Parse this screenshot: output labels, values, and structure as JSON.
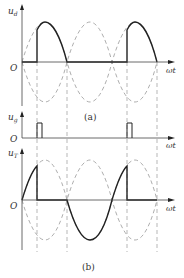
{
  "figure": {
    "panel_a": {
      "caption": "(a)",
      "ud_axis_label": "u",
      "ud_axis_sub": "d",
      "ug_axis_label": "u",
      "ug_axis_sub": "g",
      "origin_label": "O",
      "x_axis_label": "ωt"
    },
    "panel_b": {
      "caption": "(b)",
      "ut_axis_label": "u",
      "ut_axis_sub": "T",
      "origin_label": "O",
      "x_axis_label": "ωt"
    },
    "colors": {
      "solid": "#333333",
      "dashed": "#8a8a8a",
      "axis": "#444444"
    }
  }
}
